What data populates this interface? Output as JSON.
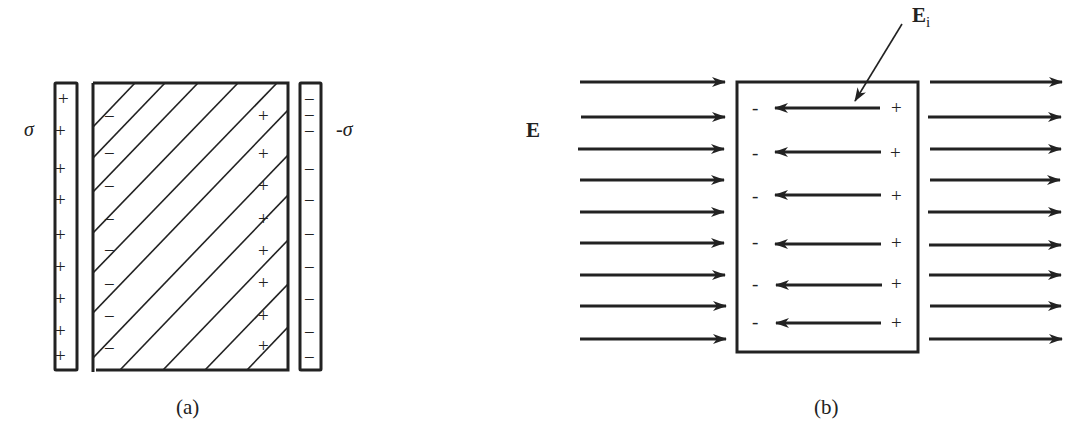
{
  "figure": {
    "panel_a": {
      "caption": "(a)",
      "left_plate_label": "σ",
      "right_plate_label": "-σ",
      "left_plate_signs": [
        "+",
        "+",
        "+",
        "+",
        "+",
        "+",
        "+",
        "+",
        "+"
      ],
      "dielectric_left_signs": [
        "−",
        "−",
        "−",
        "−",
        "−",
        "−",
        "−",
        "−"
      ],
      "dielectric_right_signs": [
        "+",
        "+",
        "+",
        "+",
        "+",
        "+",
        "+",
        "+"
      ],
      "right_plate_signs": [
        "−",
        "−",
        "−",
        "−",
        "−",
        "−",
        "−",
        "−",
        "−",
        "−"
      ]
    },
    "panel_b": {
      "caption": "(b)",
      "external_field_label": "E",
      "internal_field_label": "E",
      "internal_field_subscript": "i",
      "left_arrow_count": 9,
      "right_arrow_count": 9,
      "internal_arrow_count": 6,
      "internal_minus": "-",
      "internal_plus": "+"
    }
  },
  "colors": {
    "ink": "#222222",
    "background": "#ffffff"
  }
}
